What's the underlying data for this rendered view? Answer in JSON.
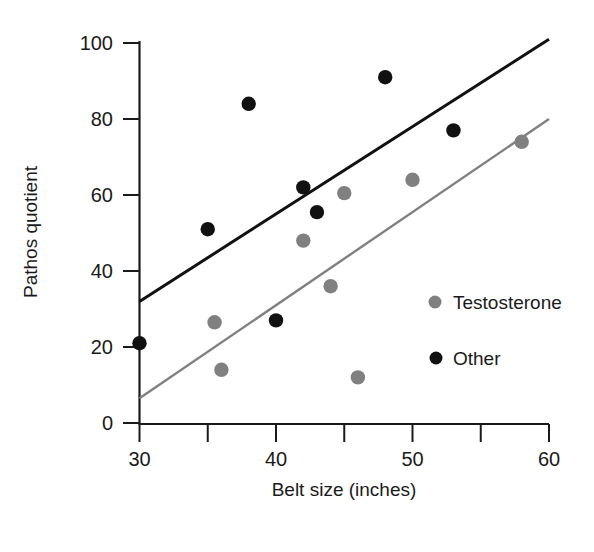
{
  "chart_data": {
    "type": "scatter",
    "title": "",
    "xlabel": "Belt size (inches)",
    "ylabel": "Pathos quotient",
    "xlim": [
      30,
      60
    ],
    "ylim": [
      0,
      100
    ],
    "xticks": [
      30,
      35,
      40,
      45,
      50,
      55,
      60
    ],
    "xtick_labels": [
      "30",
      "",
      "40",
      "",
      "50",
      "",
      "60"
    ],
    "yticks": [
      0,
      20,
      40,
      60,
      80,
      100
    ],
    "ytick_labels": [
      "0",
      "20",
      "40",
      "60",
      "80",
      "100"
    ],
    "grid": false,
    "legend_position": "center-right",
    "series": [
      {
        "name": "Testosterone",
        "color": "#808080",
        "marker": "circle",
        "points": [
          {
            "x": 35.5,
            "y": 26.5
          },
          {
            "x": 36.0,
            "y": 14.0
          },
          {
            "x": 42.0,
            "y": 48.0
          },
          {
            "x": 44.0,
            "y": 36.0
          },
          {
            "x": 45.0,
            "y": 60.5
          },
          {
            "x": 46.0,
            "y": 12.0
          },
          {
            "x": 50.0,
            "y": 64.0
          },
          {
            "x": 58.0,
            "y": 74.0
          }
        ],
        "trendline": {
          "x1": 30,
          "y1": 6.5,
          "x2": 60,
          "y2": 80.0
        }
      },
      {
        "name": "Other",
        "color": "#111111",
        "marker": "circle",
        "points": [
          {
            "x": 30.0,
            "y": 21.0
          },
          {
            "x": 35.0,
            "y": 51.0
          },
          {
            "x": 38.0,
            "y": 84.0
          },
          {
            "x": 40.0,
            "y": 27.0
          },
          {
            "x": 42.0,
            "y": 62.0
          },
          {
            "x": 43.0,
            "y": 55.5
          },
          {
            "x": 48.0,
            "y": 91.0
          },
          {
            "x": 53.0,
            "y": 77.0
          }
        ],
        "trendline": {
          "x1": 30,
          "y1": 32.0,
          "x2": 60,
          "y2": 101.0
        }
      }
    ],
    "legend": [
      {
        "label": "Testosterone",
        "color": "#808080"
      },
      {
        "label": "Other",
        "color": "#111111"
      }
    ]
  },
  "axis": {
    "x_title": "Belt size (inches)",
    "y_title": "Pathos quotient",
    "x_labels": [
      "30",
      "40",
      "50",
      "60"
    ],
    "y_labels": [
      "0",
      "20",
      "40",
      "60",
      "80",
      "100"
    ]
  },
  "legend": {
    "testosterone_label": "Testosterone",
    "other_label": "Other"
  },
  "colors": {
    "series_testosterone": "#808080",
    "series_other": "#111111",
    "axis": "#1a1a1a",
    "background": "#ffffff"
  }
}
